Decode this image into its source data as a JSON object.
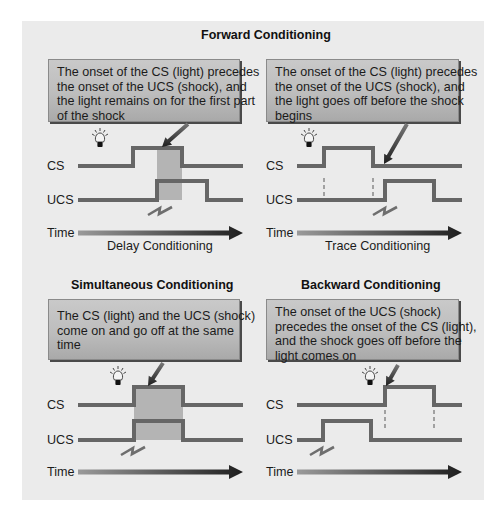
{
  "figure": {
    "colors": {
      "background": "#ebebeb",
      "signal_line": "#666666",
      "shaded_region": "#b4b4b4",
      "callout_top": "#c9c9c9",
      "callout_bottom": "#a9a9a9",
      "callout_shadow": "#4a4a4a",
      "arrow_dark": "#2a2a2a",
      "time_arrow_start": "#9a9a9a",
      "time_arrow_end": "#1e1e1e"
    },
    "section_titles": {
      "forward": "Forward Conditioning",
      "simultaneous": "Simultaneous Conditioning",
      "backward": "Backward Conditioning"
    },
    "panels": [
      {
        "id": "delay",
        "callout_lines": [
          "The onset of the CS (light) precedes",
          "the onset of the UCS (shock), and",
          "the light remains on for the first part",
          "of the shock"
        ],
        "cs_label": "CS",
        "ucs_label": "UCS",
        "time_label": "Time",
        "caption": "Delay Conditioning",
        "cs": {
          "x0": 78,
          "x1": 243,
          "on": 133,
          "off": 182,
          "base": 166,
          "high": 148
        },
        "ucs": {
          "x0": 78,
          "x1": 243,
          "on": 157,
          "off": 207,
          "base": 200,
          "high": 181
        },
        "shade": {
          "x0": 157,
          "x1": 182,
          "y0": 148,
          "y1": 200
        },
        "dashes": [],
        "bulb": {
          "x": 100,
          "y": 140
        },
        "shock": {
          "x": 148,
          "y": 207
        },
        "pointer": {
          "x0": 188,
          "y0": 124,
          "x1": 162,
          "y1": 147
        },
        "time_arrow": {
          "x0": 78,
          "x1": 243,
          "y": 233
        }
      },
      {
        "id": "trace",
        "callout_lines": [
          "The onset of the CS (light) precedes",
          "the onset of the UCS (shock), and",
          "the light goes off before the shock",
          "begins"
        ],
        "cs_label": "CS",
        "ucs_label": "UCS",
        "time_label": "Time",
        "caption": "Trace Conditioning",
        "cs": {
          "x0": 297,
          "x1": 462,
          "on": 324,
          "off": 373,
          "base": 166,
          "high": 148
        },
        "ucs": {
          "x0": 297,
          "x1": 462,
          "on": 385,
          "off": 434,
          "base": 200,
          "high": 181
        },
        "shade": null,
        "dashes": [
          {
            "x": 324,
            "y0": 178,
            "y1": 196
          },
          {
            "x": 373,
            "y0": 178,
            "y1": 196
          }
        ],
        "bulb": {
          "x": 309,
          "y": 140
        },
        "shock": {
          "x": 373,
          "y": 207
        },
        "pointer": {
          "x0": 407,
          "y0": 124,
          "x1": 384,
          "y1": 164
        },
        "time_arrow": {
          "x0": 297,
          "x1": 462,
          "y": 233
        }
      },
      {
        "id": "simultaneous",
        "callout_lines": [
          "The CS (light) and the UCS (shock)",
          "come on and go off at the same",
          "time"
        ],
        "cs_label": "CS",
        "ucs_label": "UCS",
        "time_label": "Time",
        "caption": "",
        "cs": {
          "x0": 78,
          "x1": 243,
          "on": 134,
          "off": 183,
          "base": 405,
          "high": 387
        },
        "ucs": {
          "x0": 78,
          "x1": 243,
          "on": 134,
          "off": 183,
          "base": 440,
          "high": 421
        },
        "shade": {
          "x0": 134,
          "x1": 183,
          "y0": 387,
          "y1": 440
        },
        "dashes": [],
        "bulb": {
          "x": 118,
          "y": 378
        },
        "shock": {
          "x": 121,
          "y": 447
        },
        "pointer": {
          "x0": 163,
          "y0": 363,
          "x1": 148,
          "y1": 386
        },
        "time_arrow": {
          "x0": 78,
          "x1": 243,
          "y": 472
        }
      },
      {
        "id": "backward",
        "callout_lines": [
          "The onset of the UCS (shock)",
          "precedes the onset of the CS (light),",
          "and the shock goes off before the",
          "light comes on"
        ],
        "cs_label": "CS",
        "ucs_label": "UCS",
        "time_label": "Time",
        "caption": "",
        "cs": {
          "x0": 297,
          "x1": 462,
          "on": 385,
          "off": 434,
          "base": 405,
          "high": 387
        },
        "ucs": {
          "x0": 297,
          "x1": 462,
          "on": 323,
          "off": 371,
          "base": 440,
          "high": 421
        },
        "shade": null,
        "dashes": [
          {
            "x": 385,
            "y0": 410,
            "y1": 430
          },
          {
            "x": 434,
            "y0": 410,
            "y1": 430
          }
        ],
        "bulb": {
          "x": 370,
          "y": 378
        },
        "shock": {
          "x": 310,
          "y": 447
        },
        "pointer": {
          "x0": 398,
          "y0": 365,
          "x1": 386,
          "y1": 386
        },
        "time_arrow": {
          "x0": 297,
          "x1": 462,
          "y": 472
        }
      }
    ]
  }
}
